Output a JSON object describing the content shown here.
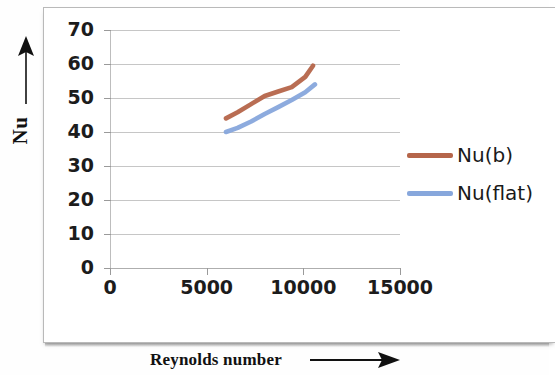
{
  "chart_data": {
    "type": "line",
    "title": "",
    "xlabel": "Reynolds number",
    "ylabel": "Nu",
    "xlim": [
      0,
      15000
    ],
    "ylim": [
      0,
      70
    ],
    "x_ticks": [
      "0",
      "5000",
      "10000",
      "15000"
    ],
    "x_tick_values": [
      0,
      5000,
      10000,
      15000
    ],
    "y_ticks": [
      "0",
      "10",
      "20",
      "30",
      "40",
      "50",
      "60",
      "70"
    ],
    "y_tick_values": [
      0,
      10,
      20,
      30,
      40,
      50,
      60,
      70
    ],
    "grid": "horizontal",
    "legend_position": "right",
    "series": [
      {
        "name": "Nu(b)",
        "color": "#b5654a",
        "x": [
          6000,
          6600,
          7300,
          8000,
          8700,
          9400,
          10100,
          10500
        ],
        "values": [
          44.0,
          45.8,
          48.2,
          50.6,
          51.9,
          53.2,
          56.2,
          59.5
        ]
      },
      {
        "name": "Nu(flat)",
        "color": "#87a7dc",
        "x": [
          6000,
          6600,
          7300,
          8000,
          8700,
          9400,
          10100,
          10600
        ],
        "values": [
          40.0,
          41.2,
          43.1,
          45.3,
          47.3,
          49.4,
          51.7,
          54.0
        ]
      }
    ]
  },
  "axes": {
    "y_title": "Nu",
    "y_arrow": "up-arrow",
    "x_title": "Reynolds number",
    "x_arrow": "right-arrow"
  },
  "legend": {
    "items": [
      {
        "label": "Nu(b)",
        "color": "#b5654a"
      },
      {
        "label": "Nu(flat)",
        "color": "#87a7dc"
      }
    ]
  },
  "colors": {
    "series_brown": "#b5654a",
    "series_blue": "#87a7dc",
    "gridline": "#c6c6c6",
    "frame": "#b9b9b9",
    "text": "#1c1c1c"
  }
}
